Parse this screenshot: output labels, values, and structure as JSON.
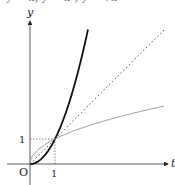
{
  "header": {
    "cut_text": "y = x, y = x², y = √x"
  },
  "chart_data": {
    "type": "line",
    "title": "",
    "xlabel": "t",
    "ylabel": "y",
    "origin_label": "O",
    "xticks": [
      "1"
    ],
    "yticks": [
      "1"
    ],
    "xlim": [
      -0.9,
      5.5
    ],
    "ylim": [
      -0.8,
      5.7
    ],
    "grid": false,
    "series": [
      {
        "name": "y = x^2",
        "style": "solid-thick",
        "color": "#111111",
        "x": [
          0,
          0.5,
          1,
          1.5,
          2,
          2.32
        ],
        "y": [
          0,
          0.25,
          1,
          2.25,
          4,
          5.38
        ]
      },
      {
        "name": "y = x",
        "style": "dotted",
        "color": "#333333",
        "x": [
          0,
          5.36
        ],
        "y": [
          0,
          5.36
        ]
      },
      {
        "name": "y = sqrt(x)",
        "style": "solid-thin",
        "color": "#999999",
        "x": [
          0,
          0.25,
          1,
          2,
          3,
          4,
          5.36
        ],
        "y": [
          0,
          0.5,
          1,
          1.41,
          1.73,
          2,
          2.32
        ]
      }
    ],
    "annotations": [
      {
        "type": "dotted-guide",
        "from": [
          0,
          1
        ],
        "to": [
          1,
          1
        ]
      },
      {
        "type": "dotted-guide",
        "from": [
          1,
          0
        ],
        "to": [
          1,
          1
        ]
      }
    ]
  }
}
